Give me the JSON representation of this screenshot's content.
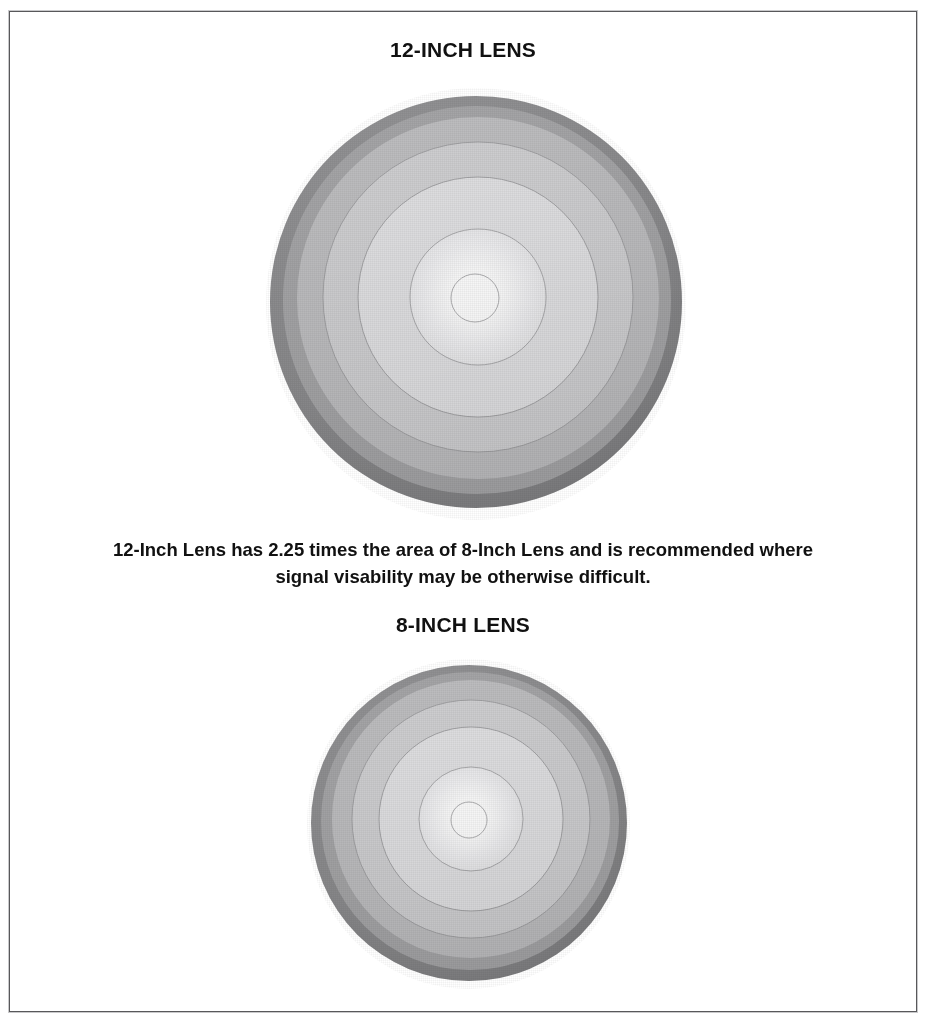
{
  "document": {
    "heading_top": "12-INCH LENS",
    "heading_bottom": "8-INCH LENS",
    "caption": "12-Inch Lens has 2.25 times the area of 8-Inch Lens and is recommended where signal visability may be otherwise difficult.",
    "bleed_text": ""
  },
  "colors": {
    "frame_border": "#58585a",
    "text": "#111111",
    "background": "#ffffff",
    "rim_dark": "#8d8d8f",
    "band_2": "#b4b4b6",
    "band_3": "#c9c9cb",
    "band_4": "#dddddf",
    "band_5": "#eeeef0",
    "center_white": "#ffffff",
    "ring_line": "#a2a2a4"
  },
  "lenses": [
    {
      "name": "12-inch-lens",
      "label": "12-INCH LENS",
      "diameter_inches": 12,
      "relative_area": 2.25,
      "rings": [
        {
          "radius_pct": 100,
          "fill": "#8d8d8f"
        },
        {
          "radius_pct": 94,
          "fill": "#a8a8aa"
        },
        {
          "radius_pct": 88,
          "fill": "#c0c0c2"
        },
        {
          "radius_pct": 75,
          "fill": "#d2d2d4"
        },
        {
          "radius_pct": 58,
          "fill": "#e4e4e6"
        },
        {
          "radius_pct": 33,
          "fill": "#f6f6f8"
        },
        {
          "radius_pct": 11,
          "fill": "#ffffff"
        }
      ]
    },
    {
      "name": "8-inch-lens",
      "label": "8-INCH LENS",
      "diameter_inches": 8,
      "relative_area": 1,
      "rings": [
        {
          "radius_pct": 100,
          "fill": "#8d8d8f"
        },
        {
          "radius_pct": 94,
          "fill": "#a8a8aa"
        },
        {
          "radius_pct": 88,
          "fill": "#c0c0c2"
        },
        {
          "radius_pct": 75,
          "fill": "#d2d2d4"
        },
        {
          "radius_pct": 58,
          "fill": "#e4e4e6"
        },
        {
          "radius_pct": 33,
          "fill": "#f6f6f8"
        },
        {
          "radius_pct": 11,
          "fill": "#ffffff"
        }
      ]
    }
  ]
}
